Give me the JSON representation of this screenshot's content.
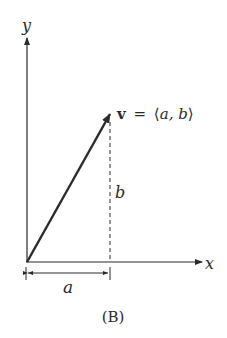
{
  "figure": {
    "caption": "(B)",
    "axes": {
      "x_label": "x",
      "y_label": "y"
    },
    "vector": {
      "name": "v",
      "equals": "=",
      "open": "⟨",
      "components": "a, b",
      "close": "⟩",
      "from": [
        0,
        0
      ],
      "to": [
        "a",
        "b"
      ]
    },
    "horizontal_component_label": "a",
    "vertical_component_label": "b",
    "colors": {
      "ink": "#2a2a2a",
      "background": "#ffffff"
    }
  }
}
